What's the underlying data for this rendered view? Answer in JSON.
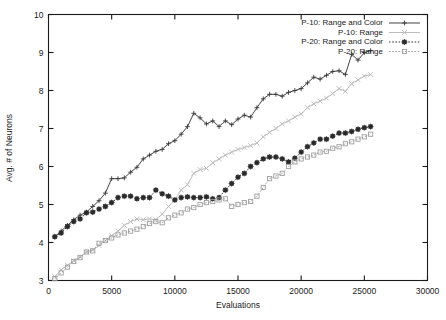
{
  "chart_data": {
    "type": "line",
    "title": "",
    "xlabel": "Evaluations",
    "ylabel": "Avg. # of Neurons",
    "xlim": [
      0,
      30000
    ],
    "ylim": [
      3,
      10
    ],
    "xticks": [
      0,
      5000,
      10000,
      15000,
      20000,
      25000,
      30000
    ],
    "xticklabels": [
      "0",
      "5000",
      "10000",
      "15000",
      "20000",
      "25000",
      "30000"
    ],
    "yticks": [
      3,
      4,
      5,
      6,
      7,
      8,
      9,
      10
    ],
    "yticklabels": [
      "3",
      "4",
      "5",
      "6",
      "7",
      "8",
      "9",
      "10"
    ],
    "grid": false,
    "legend_position": "top-right",
    "series": [
      {
        "name": "P-10: Range and Color",
        "color": "#3a3a3a",
        "marker": "plus",
        "dash": "none",
        "x": [
          500,
          1000,
          1500,
          2000,
          2500,
          3000,
          3500,
          4000,
          4500,
          5000,
          5500,
          6000,
          6500,
          7000,
          7500,
          8000,
          8500,
          9000,
          9500,
          10000,
          10500,
          11000,
          11500,
          12000,
          12500,
          13000,
          13500,
          14000,
          14500,
          15000,
          15500,
          16000,
          16500,
          17000,
          17500,
          18000,
          18500,
          19000,
          19500,
          20000,
          20500,
          21000,
          21500,
          22000,
          22500,
          23000,
          23500,
          24000,
          24500,
          25000,
          25500
        ],
        "y": [
          4.15,
          4.3,
          4.45,
          4.6,
          4.72,
          4.8,
          4.95,
          5.1,
          5.3,
          5.68,
          5.68,
          5.7,
          5.85,
          5.98,
          6.2,
          6.3,
          6.4,
          6.45,
          6.6,
          6.68,
          6.85,
          7.05,
          7.4,
          7.28,
          7.12,
          7.2,
          7.05,
          7.2,
          7.1,
          7.25,
          7.35,
          7.3,
          7.55,
          7.78,
          7.9,
          7.9,
          7.85,
          7.95,
          8.0,
          8.05,
          8.2,
          8.35,
          8.3,
          8.4,
          8.5,
          8.52,
          8.42,
          8.95,
          8.8,
          9.0,
          9.05
        ]
      },
      {
        "name": "P-10: Range",
        "color": "#b9b9b9",
        "marker": "x",
        "dash": "none",
        "x": [
          500,
          1000,
          1500,
          2000,
          2500,
          3000,
          3500,
          4000,
          4500,
          5000,
          5500,
          6000,
          6500,
          7000,
          7500,
          8000,
          8500,
          9000,
          9500,
          10000,
          10500,
          11000,
          11500,
          12000,
          12500,
          13000,
          13500,
          14000,
          14500,
          15000,
          15500,
          16000,
          16500,
          17000,
          17500,
          18000,
          18500,
          19000,
          19500,
          20000,
          20500,
          21000,
          21500,
          22000,
          22500,
          23000,
          23500,
          24000,
          24500,
          25000,
          25500
        ],
        "y": [
          3.1,
          3.28,
          3.4,
          3.52,
          3.62,
          3.75,
          3.8,
          3.92,
          4.05,
          4.18,
          4.3,
          4.45,
          4.55,
          4.62,
          4.6,
          4.62,
          4.6,
          4.75,
          4.95,
          5.12,
          5.38,
          5.52,
          5.82,
          5.92,
          5.95,
          6.1,
          6.2,
          6.3,
          6.38,
          6.45,
          6.5,
          6.55,
          6.62,
          6.78,
          6.9,
          7.0,
          7.12,
          7.2,
          7.3,
          7.38,
          7.55,
          7.65,
          7.72,
          7.8,
          7.92,
          8.05,
          7.98,
          8.18,
          8.28,
          8.38,
          8.42
        ]
      },
      {
        "name": "P-20: Range and Color",
        "color": "#2b2b2b",
        "marker": "star",
        "dash": "dotted",
        "x": [
          500,
          1000,
          1500,
          2000,
          2500,
          3000,
          3500,
          4000,
          4500,
          5000,
          5500,
          6000,
          6500,
          7000,
          7500,
          8000,
          8500,
          9000,
          9500,
          10000,
          10500,
          11000,
          11500,
          12000,
          12500,
          13000,
          13500,
          14000,
          14500,
          15000,
          15500,
          16000,
          16500,
          17000,
          17500,
          18000,
          18500,
          19000,
          19500,
          20000,
          20500,
          21000,
          21500,
          22000,
          22500,
          23000,
          23500,
          24000,
          24500,
          25000,
          25500
        ],
        "y": [
          4.15,
          4.25,
          4.42,
          4.55,
          4.62,
          4.78,
          4.8,
          4.88,
          4.95,
          5.05,
          5.18,
          5.22,
          5.22,
          5.15,
          5.18,
          5.18,
          5.38,
          5.28,
          5.22,
          5.12,
          5.18,
          5.2,
          5.18,
          5.18,
          5.2,
          5.15,
          5.18,
          5.38,
          5.55,
          5.72,
          5.82,
          6.0,
          6.1,
          6.2,
          6.25,
          6.25,
          6.2,
          6.12,
          6.22,
          6.38,
          6.52,
          6.62,
          6.72,
          6.72,
          6.8,
          6.88,
          6.88,
          6.92,
          6.98,
          7.02,
          7.05
        ]
      },
      {
        "name": "P-20: Range",
        "color": "#9f9f9f",
        "marker": "square",
        "dash": "dotted",
        "x": [
          500,
          1000,
          1500,
          2000,
          2500,
          3000,
          3500,
          4000,
          4500,
          5000,
          5500,
          6000,
          6500,
          7000,
          7500,
          8000,
          8500,
          9000,
          9500,
          10000,
          10500,
          11000,
          11500,
          12000,
          12500,
          13000,
          13500,
          14000,
          14500,
          15000,
          15500,
          16000,
          16500,
          17000,
          17500,
          18000,
          18500,
          19000,
          19500,
          20000,
          20500,
          21000,
          21500,
          22000,
          22500,
          23000,
          23500,
          24000,
          24500,
          25000,
          25500
        ],
        "y": [
          3.05,
          3.2,
          3.35,
          3.5,
          3.6,
          3.75,
          3.78,
          3.98,
          4.05,
          4.12,
          4.2,
          4.25,
          4.3,
          4.35,
          4.42,
          4.5,
          4.55,
          4.52,
          4.65,
          4.72,
          4.78,
          4.88,
          4.92,
          5.0,
          5.05,
          5.08,
          5.12,
          5.15,
          4.95,
          5.0,
          5.05,
          5.08,
          5.22,
          5.45,
          5.68,
          5.75,
          5.82,
          6.0,
          6.12,
          6.2,
          6.25,
          6.3,
          6.38,
          6.4,
          6.48,
          6.52,
          6.6,
          6.65,
          6.72,
          6.78,
          6.85
        ]
      }
    ]
  },
  "axis": {
    "ylabel": "Avg. # of Neurons",
    "xlabel": "Evaluations"
  },
  "legend": {
    "entries": [
      {
        "label": "P-10: Range and Color"
      },
      {
        "label": "P-10: Range"
      },
      {
        "label": "P-20: Range and Color"
      },
      {
        "label": "P-20: Range"
      }
    ]
  }
}
